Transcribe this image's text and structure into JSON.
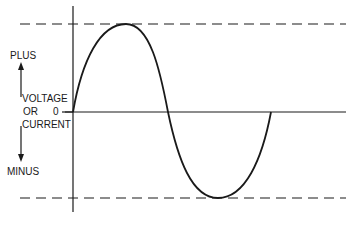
{
  "diagram": {
    "type": "sine-wave",
    "labels": {
      "plus": "PLUS",
      "minus": "MINUS",
      "voltage": "VOLTAGE",
      "or": "OR",
      "current": "CURRENT",
      "zero": "0"
    },
    "waveform": {
      "start_x": 73,
      "end_x": 271,
      "zero_y": 112,
      "peak_y": 24,
      "trough_y": 198,
      "peak_x": 126,
      "trough_x": 218,
      "mid_crossing_x": 168
    },
    "reference_lines": {
      "max_level": "dashed",
      "min_level": "dashed"
    },
    "colors": {
      "line": "#1a1a1a",
      "background": "#ffffff"
    }
  }
}
